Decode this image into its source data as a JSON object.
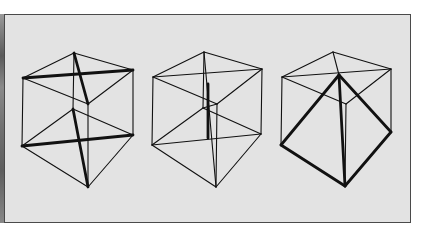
{
  "figure": {
    "colors": {
      "background": "#e3e3e3",
      "frame": "#4a4a4a",
      "line": "#111111"
    },
    "cubes": [
      {
        "name": "cube-with-two-tetrahedra-diagonals",
        "vertices": {
          "tb": [
            74,
            53
          ],
          "tl": [
            23,
            78
          ],
          "tr": [
            133,
            70
          ],
          "tf": [
            88,
            104
          ],
          "bb": [
            73,
            109
          ],
          "bl": [
            22,
            146
          ],
          "br": [
            133,
            135
          ],
          "bf": [
            88,
            187
          ]
        },
        "thin_edges": [
          [
            "tb",
            "tl"
          ],
          [
            "tb",
            "tr"
          ],
          [
            "tl",
            "tf"
          ],
          [
            "tr",
            "tf"
          ],
          [
            "tl",
            "bl"
          ],
          [
            "tr",
            "br"
          ],
          [
            "tf",
            "bf"
          ],
          [
            "bb",
            "bl"
          ],
          [
            "bb",
            "br"
          ],
          [
            "bl",
            "bf"
          ],
          [
            "br",
            "bf"
          ],
          [
            "tb",
            "bb"
          ]
        ],
        "thick_edges": [
          [
            "tl",
            "tr"
          ],
          [
            "tb",
            "tf"
          ],
          [
            "bl",
            "br"
          ],
          [
            "bb",
            "bf"
          ]
        ]
      },
      {
        "name": "cube-with-inner-bipyramid",
        "vertices": {
          "tb": [
            204,
            52
          ],
          "tl": [
            153,
            77
          ],
          "tr": [
            262,
            69
          ],
          "tf": [
            217,
            104
          ],
          "bb": [
            203,
            108
          ],
          "bl": [
            152,
            145
          ],
          "br": [
            261,
            134
          ],
          "bf": [
            216,
            187
          ]
        },
        "thin_edges": [
          [
            "tb",
            "tl"
          ],
          [
            "tb",
            "tr"
          ],
          [
            "tl",
            "tf"
          ],
          [
            "tr",
            "tf"
          ],
          [
            "tl",
            "tr"
          ],
          [
            "tl",
            "bl"
          ],
          [
            "tr",
            "br"
          ],
          [
            "tf",
            "bf"
          ],
          [
            "bb",
            "bl"
          ],
          [
            "bb",
            "br"
          ],
          [
            "bl",
            "bf"
          ],
          [
            "br",
            "bf"
          ],
          [
            "bl",
            "br"
          ],
          [
            "tb",
            "bb"
          ],
          [
            "tb",
            "bf"
          ],
          [
            "bb",
            "tf"
          ]
        ],
        "thick_edges": [
          [
            "c1",
            "c2"
          ]
        ],
        "extra_points": {
          "c1": [
            208,
            84
          ],
          "c2": [
            208,
            138
          ]
        }
      },
      {
        "name": "cube-with-inscribed-pyramid",
        "vertices": {
          "tb": [
            333,
            52
          ],
          "tl": [
            282,
            77
          ],
          "tr": [
            391,
            69
          ],
          "tf": [
            346,
            104
          ],
          "bl": [
            281,
            145
          ],
          "br": [
            391,
            132
          ],
          "bf": [
            345,
            186
          ],
          "apex": [
            339,
            75
          ]
        },
        "thin_edges": [
          [
            "tb",
            "tl"
          ],
          [
            "tb",
            "tr"
          ],
          [
            "tl",
            "tf"
          ],
          [
            "tr",
            "tf"
          ],
          [
            "tl",
            "tr"
          ],
          [
            "tl",
            "bl"
          ],
          [
            "tr",
            "br"
          ],
          [
            "tf",
            "bf"
          ],
          [
            "tb",
            "apex"
          ]
        ],
        "thick_edges": [
          [
            "apex",
            "bl"
          ],
          [
            "apex",
            "br"
          ],
          [
            "apex",
            "bf"
          ],
          [
            "bl",
            "bf"
          ],
          [
            "br",
            "bf"
          ]
        ]
      }
    ]
  }
}
